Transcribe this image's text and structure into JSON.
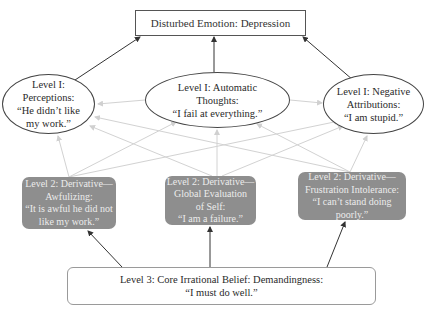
{
  "diagram": {
    "title_node": {
      "label": "Disturbed Emotion: Depression"
    },
    "level1": [
      {
        "id": "perceptions",
        "lines": [
          "Level I:",
          "Perceptions:",
          "“He didn’t like",
          "my work.”"
        ]
      },
      {
        "id": "automatic-thoughts",
        "lines": [
          "Level I: Automatic",
          "Thoughts:",
          "“I fail at everything.”"
        ]
      },
      {
        "id": "negative-attributions",
        "lines": [
          "Level I: Negative",
          "Attributions:",
          "“I am stupid.”"
        ]
      }
    ],
    "level2": [
      {
        "id": "awfulizing",
        "lines": [
          "Level 2: Derivative—",
          "Awfulizing:",
          "“It is awful he did not",
          "like my work.”"
        ]
      },
      {
        "id": "global-evaluation",
        "lines": [
          "Level 2: Derivative—",
          "Global Evaluation",
          "of Self:",
          "“I am a failure.”"
        ]
      },
      {
        "id": "frustration-intolerance",
        "lines": [
          "Level 2: Derivative—",
          "Frustration Intolerance:",
          "“I can’t stand doing",
          "poorly.”"
        ]
      }
    ],
    "level3": {
      "lines": [
        "Level 3: Core Irrational Belief: Demandingness:",
        "“I must do well.”"
      ]
    },
    "colors": {
      "dark_arrow": "#333333",
      "light_arrow": "#cfcfcf",
      "level2_fill": "#8e8e8e",
      "level2_text": "#ececec"
    }
  }
}
